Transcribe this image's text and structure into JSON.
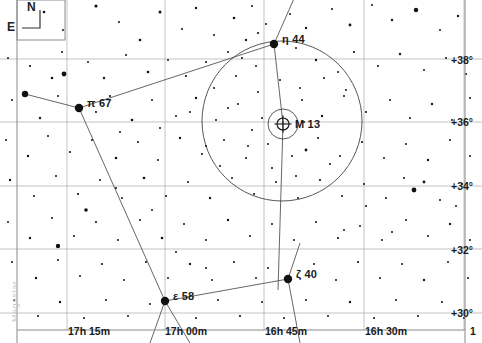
{
  "chart_data": {
    "type": "scatter",
    "title": "",
    "xlabel": "Right Ascension",
    "ylabel": "Declination",
    "grid": true,
    "legend": null,
    "xlim": [
      "17h 22m",
      "16h 22m"
    ],
    "ylim": [
      29.2,
      39.2
    ],
    "ra_ticks": [
      {
        "label": "17h 15m",
        "x": 68
      },
      {
        "label": "17h 00m",
        "x": 165
      },
      {
        "label": "16h 45m",
        "x": 265
      },
      {
        "label": "16h 30m",
        "x": 365
      },
      {
        "label": "1",
        "x": 470
      }
    ],
    "dec_ticks": [
      {
        "label": "+38°",
        "y": 60
      },
      {
        "label": "+36°",
        "y": 122
      },
      {
        "label": "+34°",
        "y": 186
      },
      {
        "label": "+32°",
        "y": 250
      },
      {
        "label": "+30°",
        "y": 313
      }
    ],
    "gridline_x": [
      67,
      165,
      264,
      364,
      464
    ],
    "gridline_y": [
      59,
      122,
      186,
      249,
      313
    ],
    "named_objects": [
      {
        "name": "η 44",
        "x": 274,
        "y": 44,
        "mag": 3.5,
        "label_dx": 8,
        "label_dy": -11
      },
      {
        "name": "π 67",
        "x": 79,
        "y": 108,
        "mag": 3.6,
        "label_dx": 8,
        "label_dy": -11
      },
      {
        "name": "ζ 40",
        "x": 288,
        "y": 279,
        "mag": 3.5,
        "label_dx": 8,
        "label_dy": -11
      },
      {
        "name": "ε 58",
        "x": 165,
        "y": 301,
        "mag": 3.7,
        "label_dx": 8,
        "label_dy": -11
      }
    ],
    "deep_sky_objects": [
      {
        "name": "M 13",
        "type": "globular-cluster",
        "x": 283,
        "y": 124,
        "r": 6,
        "halo_r": 15,
        "label_dx": 12,
        "label_dy": -6
      }
    ],
    "fov_circle": {
      "cx": 282,
      "cy": 121,
      "r": 80
    },
    "constellation_lines": [
      {
        "from": [
          25,
          94
        ],
        "to": [
          79,
          108
        ]
      },
      {
        "from": [
          79,
          108
        ],
        "to": [
          274,
          44
        ]
      },
      {
        "from": [
          79,
          108
        ],
        "to": [
          165,
          301
        ]
      },
      {
        "from": [
          165,
          301
        ],
        "to": [
          288,
          279
        ]
      },
      {
        "from": [
          274,
          44
        ],
        "to": [
          283,
          124
        ]
      },
      {
        "from": [
          283,
          124
        ],
        "to": [
          278,
          290
        ]
      },
      {
        "from": [
          274,
          44
        ],
        "to": [
          296,
          -6
        ]
      },
      {
        "from": [
          165,
          301
        ],
        "to": [
          150,
          343
        ]
      },
      {
        "from": [
          165,
          301
        ],
        "to": [
          190,
          343
        ]
      },
      {
        "from": [
          288,
          279
        ],
        "to": [
          300,
          343
        ]
      },
      {
        "from": [
          288,
          279
        ],
        "to": [
          300,
          243
        ]
      }
    ],
    "stars": [
      {
        "x": 25,
        "y": 94,
        "r": 3.2
      },
      {
        "x": 44,
        "y": 12,
        "r": 1.3
      },
      {
        "x": 63,
        "y": 30,
        "r": 1.0
      },
      {
        "x": 96,
        "y": 6,
        "r": 1.6
      },
      {
        "x": 119,
        "y": 22,
        "r": 1.0
      },
      {
        "x": 140,
        "y": 40,
        "r": 1.3
      },
      {
        "x": 160,
        "y": 12,
        "r": 1.5
      },
      {
        "x": 182,
        "y": 29,
        "r": 1.0
      },
      {
        "x": 196,
        "y": 8,
        "r": 1.2
      },
      {
        "x": 214,
        "y": 35,
        "r": 1.0
      },
      {
        "x": 234,
        "y": 18,
        "r": 1.3
      },
      {
        "x": 252,
        "y": 6,
        "r": 1.0
      },
      {
        "x": 258,
        "y": 33,
        "r": 1.1
      },
      {
        "x": 290,
        "y": 14,
        "r": 1.0
      },
      {
        "x": 306,
        "y": 28,
        "r": 1.2
      },
      {
        "x": 332,
        "y": 9,
        "r": 1.0
      },
      {
        "x": 350,
        "y": 25,
        "r": 1.4
      },
      {
        "x": 372,
        "y": 5,
        "r": 1.0
      },
      {
        "x": 392,
        "y": 20,
        "r": 1.2
      },
      {
        "x": 416,
        "y": 10,
        "r": 2.2
      },
      {
        "x": 440,
        "y": 30,
        "r": 1.0
      },
      {
        "x": 458,
        "y": 16,
        "r": 1.2
      },
      {
        "x": 8,
        "y": 58,
        "r": 1.0
      },
      {
        "x": 30,
        "y": 66,
        "r": 1.1
      },
      {
        "x": 52,
        "y": 78,
        "r": 1.3
      },
      {
        "x": 62,
        "y": 52,
        "r": 1.0
      },
      {
        "x": 88,
        "y": 62,
        "r": 1.0
      },
      {
        "x": 104,
        "y": 78,
        "r": 1.2
      },
      {
        "x": 126,
        "y": 55,
        "r": 1.0
      },
      {
        "x": 148,
        "y": 72,
        "r": 1.3
      },
      {
        "x": 168,
        "y": 60,
        "r": 1.0
      },
      {
        "x": 186,
        "y": 76,
        "r": 1.1
      },
      {
        "x": 206,
        "y": 62,
        "r": 1.0
      },
      {
        "x": 228,
        "y": 52,
        "r": 1.0
      },
      {
        "x": 246,
        "y": 40,
        "r": 1.2
      },
      {
        "x": 256,
        "y": 66,
        "r": 1.0
      },
      {
        "x": 242,
        "y": 58,
        "r": 1.0
      },
      {
        "x": 266,
        "y": 24,
        "r": 1.0
      },
      {
        "x": 296,
        "y": 48,
        "r": 1.0
      },
      {
        "x": 316,
        "y": 60,
        "r": 1.2
      },
      {
        "x": 338,
        "y": 72,
        "r": 1.0
      },
      {
        "x": 354,
        "y": 52,
        "r": 1.1
      },
      {
        "x": 378,
        "y": 66,
        "r": 1.0
      },
      {
        "x": 400,
        "y": 54,
        "r": 1.2
      },
      {
        "x": 424,
        "y": 70,
        "r": 1.0
      },
      {
        "x": 446,
        "y": 58,
        "r": 1.0
      },
      {
        "x": 466,
        "y": 74,
        "r": 1.1
      },
      {
        "x": 12,
        "y": 100,
        "r": 1.0
      },
      {
        "x": 40,
        "y": 118,
        "r": 1.2
      },
      {
        "x": 58,
        "y": 96,
        "r": 1.0
      },
      {
        "x": 64,
        "y": 74,
        "r": 2.4
      },
      {
        "x": 96,
        "y": 112,
        "r": 1.0
      },
      {
        "x": 110,
        "y": 96,
        "r": 1.1
      },
      {
        "x": 132,
        "y": 120,
        "r": 1.3
      },
      {
        "x": 152,
        "y": 100,
        "r": 1.0
      },
      {
        "x": 176,
        "y": 116,
        "r": 1.0
      },
      {
        "x": 196,
        "y": 98,
        "r": 1.2
      },
      {
        "x": 216,
        "y": 120,
        "r": 1.0
      },
      {
        "x": 238,
        "y": 104,
        "r": 1.0
      },
      {
        "x": 262,
        "y": 118,
        "r": 1.0
      },
      {
        "x": 302,
        "y": 100,
        "r": 1.0
      },
      {
        "x": 322,
        "y": 116,
        "r": 1.2
      },
      {
        "x": 344,
        "y": 96,
        "r": 1.0
      },
      {
        "x": 366,
        "y": 112,
        "r": 1.1
      },
      {
        "x": 390,
        "y": 100,
        "r": 1.0
      },
      {
        "x": 410,
        "y": 118,
        "r": 1.0
      },
      {
        "x": 432,
        "y": 104,
        "r": 1.2
      },
      {
        "x": 452,
        "y": 120,
        "r": 1.0
      },
      {
        "x": 470,
        "y": 98,
        "r": 1.0
      },
      {
        "x": 6,
        "y": 140,
        "r": 1.0
      },
      {
        "x": 28,
        "y": 156,
        "r": 1.2
      },
      {
        "x": 48,
        "y": 136,
        "r": 1.0
      },
      {
        "x": 70,
        "y": 152,
        "r": 1.1
      },
      {
        "x": 92,
        "y": 140,
        "r": 1.0
      },
      {
        "x": 116,
        "y": 158,
        "r": 1.3
      },
      {
        "x": 138,
        "y": 142,
        "r": 1.0
      },
      {
        "x": 158,
        "y": 160,
        "r": 1.0
      },
      {
        "x": 180,
        "y": 138,
        "r": 1.2
      },
      {
        "x": 202,
        "y": 154,
        "r": 1.0
      },
      {
        "x": 224,
        "y": 140,
        "r": 1.0
      },
      {
        "x": 246,
        "y": 158,
        "r": 1.0
      },
      {
        "x": 268,
        "y": 144,
        "r": 1.0
      },
      {
        "x": 292,
        "y": 156,
        "r": 1.0
      },
      {
        "x": 306,
        "y": 150,
        "r": 1.4
      },
      {
        "x": 318,
        "y": 138,
        "r": 1.0
      },
      {
        "x": 340,
        "y": 156,
        "r": 1.0
      },
      {
        "x": 362,
        "y": 142,
        "r": 1.1
      },
      {
        "x": 384,
        "y": 158,
        "r": 1.0
      },
      {
        "x": 406,
        "y": 144,
        "r": 1.0
      },
      {
        "x": 428,
        "y": 160,
        "r": 1.2
      },
      {
        "x": 450,
        "y": 140,
        "r": 1.0
      },
      {
        "x": 470,
        "y": 156,
        "r": 1.0
      },
      {
        "x": 10,
        "y": 180,
        "r": 1.2
      },
      {
        "x": 34,
        "y": 196,
        "r": 1.0
      },
      {
        "x": 56,
        "y": 176,
        "r": 1.0
      },
      {
        "x": 78,
        "y": 194,
        "r": 1.1
      },
      {
        "x": 100,
        "y": 180,
        "r": 1.0
      },
      {
        "x": 122,
        "y": 198,
        "r": 1.0
      },
      {
        "x": 144,
        "y": 178,
        "r": 1.3
      },
      {
        "x": 166,
        "y": 196,
        "r": 1.0
      },
      {
        "x": 188,
        "y": 182,
        "r": 1.0
      },
      {
        "x": 210,
        "y": 198,
        "r": 1.2
      },
      {
        "x": 232,
        "y": 178,
        "r": 1.0
      },
      {
        "x": 254,
        "y": 194,
        "r": 1.0
      },
      {
        "x": 276,
        "y": 182,
        "r": 1.0
      },
      {
        "x": 298,
        "y": 198,
        "r": 1.0
      },
      {
        "x": 320,
        "y": 180,
        "r": 1.1
      },
      {
        "x": 342,
        "y": 196,
        "r": 1.0
      },
      {
        "x": 364,
        "y": 184,
        "r": 1.0
      },
      {
        "x": 386,
        "y": 198,
        "r": 1.0
      },
      {
        "x": 404,
        "y": 178,
        "r": 1.0
      },
      {
        "x": 414,
        "y": 190,
        "r": 2.4
      },
      {
        "x": 424,
        "y": 182,
        "r": 1.4
      },
      {
        "x": 440,
        "y": 200,
        "r": 1.0
      },
      {
        "x": 462,
        "y": 184,
        "r": 1.0
      },
      {
        "x": 8,
        "y": 222,
        "r": 1.0
      },
      {
        "x": 30,
        "y": 238,
        "r": 1.2
      },
      {
        "x": 52,
        "y": 218,
        "r": 1.0
      },
      {
        "x": 74,
        "y": 236,
        "r": 1.0
      },
      {
        "x": 96,
        "y": 222,
        "r": 1.1
      },
      {
        "x": 118,
        "y": 240,
        "r": 1.0
      },
      {
        "x": 140,
        "y": 220,
        "r": 1.0
      },
      {
        "x": 162,
        "y": 238,
        "r": 1.3
      },
      {
        "x": 184,
        "y": 224,
        "r": 1.0
      },
      {
        "x": 206,
        "y": 240,
        "r": 1.0
      },
      {
        "x": 228,
        "y": 220,
        "r": 1.2
      },
      {
        "x": 250,
        "y": 236,
        "r": 1.0
      },
      {
        "x": 272,
        "y": 224,
        "r": 1.0
      },
      {
        "x": 294,
        "y": 240,
        "r": 1.0
      },
      {
        "x": 316,
        "y": 222,
        "r": 1.0
      },
      {
        "x": 338,
        "y": 238,
        "r": 1.1
      },
      {
        "x": 360,
        "y": 226,
        "r": 1.0
      },
      {
        "x": 382,
        "y": 240,
        "r": 1.0
      },
      {
        "x": 406,
        "y": 220,
        "r": 1.0
      },
      {
        "x": 428,
        "y": 236,
        "r": 1.0
      },
      {
        "x": 450,
        "y": 224,
        "r": 1.2
      },
      {
        "x": 470,
        "y": 240,
        "r": 1.0
      },
      {
        "x": 12,
        "y": 262,
        "r": 1.0
      },
      {
        "x": 36,
        "y": 278,
        "r": 1.2
      },
      {
        "x": 58,
        "y": 260,
        "r": 1.0
      },
      {
        "x": 80,
        "y": 276,
        "r": 1.0
      },
      {
        "x": 102,
        "y": 264,
        "r": 1.1
      },
      {
        "x": 124,
        "y": 280,
        "r": 1.0
      },
      {
        "x": 146,
        "y": 262,
        "r": 1.0
      },
      {
        "x": 168,
        "y": 278,
        "r": 1.0
      },
      {
        "x": 190,
        "y": 264,
        "r": 1.2
      },
      {
        "x": 212,
        "y": 280,
        "r": 1.0
      },
      {
        "x": 234,
        "y": 262,
        "r": 1.0
      },
      {
        "x": 256,
        "y": 278,
        "r": 1.0
      },
      {
        "x": 268,
        "y": 268,
        "r": 1.0
      },
      {
        "x": 314,
        "y": 264,
        "r": 1.0
      },
      {
        "x": 336,
        "y": 280,
        "r": 1.0
      },
      {
        "x": 358,
        "y": 262,
        "r": 1.1
      },
      {
        "x": 380,
        "y": 278,
        "r": 1.0
      },
      {
        "x": 402,
        "y": 264,
        "r": 1.0
      },
      {
        "x": 424,
        "y": 280,
        "r": 1.2
      },
      {
        "x": 448,
        "y": 262,
        "r": 1.0
      },
      {
        "x": 468,
        "y": 278,
        "r": 1.0
      },
      {
        "x": 14,
        "y": 300,
        "r": 1.0
      },
      {
        "x": 38,
        "y": 316,
        "r": 1.0
      },
      {
        "x": 60,
        "y": 302,
        "r": 1.2
      },
      {
        "x": 84,
        "y": 318,
        "r": 1.0
      },
      {
        "x": 106,
        "y": 300,
        "r": 1.0
      },
      {
        "x": 128,
        "y": 316,
        "r": 1.0
      },
      {
        "x": 150,
        "y": 304,
        "r": 1.0
      },
      {
        "x": 196,
        "y": 318,
        "r": 1.0
      },
      {
        "x": 218,
        "y": 300,
        "r": 1.0
      },
      {
        "x": 240,
        "y": 316,
        "r": 1.1
      },
      {
        "x": 262,
        "y": 302,
        "r": 1.0
      },
      {
        "x": 284,
        "y": 318,
        "r": 1.0
      },
      {
        "x": 306,
        "y": 300,
        "r": 1.0
      },
      {
        "x": 328,
        "y": 316,
        "r": 1.0
      },
      {
        "x": 350,
        "y": 302,
        "r": 1.2
      },
      {
        "x": 374,
        "y": 318,
        "r": 1.0
      },
      {
        "x": 396,
        "y": 300,
        "r": 1.0
      },
      {
        "x": 418,
        "y": 316,
        "r": 1.0
      },
      {
        "x": 442,
        "y": 302,
        "r": 1.0
      },
      {
        "x": 464,
        "y": 318,
        "r": 1.0
      },
      {
        "x": 214,
        "y": 88,
        "r": 1.0
      },
      {
        "x": 236,
        "y": 76,
        "r": 1.0
      },
      {
        "x": 258,
        "y": 92,
        "r": 1.0
      },
      {
        "x": 280,
        "y": 80,
        "r": 1.0
      },
      {
        "x": 300,
        "y": 88,
        "r": 1.0
      },
      {
        "x": 324,
        "y": 78,
        "r": 1.0
      },
      {
        "x": 346,
        "y": 90,
        "r": 1.0
      },
      {
        "x": 228,
        "y": 108,
        "r": 1.0
      },
      {
        "x": 252,
        "y": 130,
        "r": 1.0
      },
      {
        "x": 304,
        "y": 122,
        "r": 1.0
      },
      {
        "x": 248,
        "y": 146,
        "r": 1.0
      },
      {
        "x": 272,
        "y": 168,
        "r": 1.0
      },
      {
        "x": 296,
        "y": 176,
        "r": 1.0
      },
      {
        "x": 330,
        "y": 164,
        "r": 1.0
      },
      {
        "x": 220,
        "y": 166,
        "r": 1.0
      },
      {
        "x": 206,
        "y": 146,
        "r": 1.0
      },
      {
        "x": 86,
        "y": 210,
        "r": 1.8
      },
      {
        "x": 58,
        "y": 246,
        "r": 2.2
      },
      {
        "x": 116,
        "y": 188,
        "r": 1.0
      },
      {
        "x": 152,
        "y": 210,
        "r": 1.0
      },
      {
        "x": 176,
        "y": 252,
        "r": 1.0
      },
      {
        "x": 206,
        "y": 268,
        "r": 1.0
      },
      {
        "x": 366,
        "y": 206,
        "r": 1.0
      },
      {
        "x": 392,
        "y": 232,
        "r": 1.0
      },
      {
        "x": 344,
        "y": 230,
        "r": 1.0
      },
      {
        "x": 456,
        "y": 206,
        "r": 1.0
      },
      {
        "x": 120,
        "y": 132,
        "r": 1.0
      },
      {
        "x": 160,
        "y": 128,
        "r": 1.0
      },
      {
        "x": 190,
        "y": 112,
        "r": 1.0
      }
    ]
  },
  "compass": {
    "north_label": "N",
    "east_label": "E"
  },
  "watermark": {
    "text": "Megastar"
  },
  "style": {
    "star_color": "#111111",
    "line_color": "#555555",
    "circle_color": "#444444",
    "border_color": "#8a8a8a",
    "grid_color": "#aaaaaa",
    "background": "#ffffff"
  }
}
